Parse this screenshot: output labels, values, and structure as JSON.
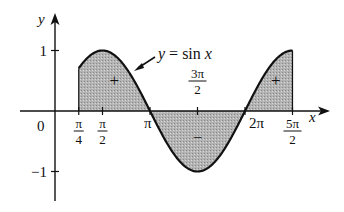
{
  "chart_data": {
    "type": "area",
    "title": "",
    "function_label": "y = sin x",
    "function_label_parts": {
      "y": "y",
      "eq": " = sin ",
      "x": "x"
    },
    "xlabel": "x",
    "ylabel": "y",
    "origin_label": "0",
    "xlim": [
      -1.1,
      8.8
    ],
    "ylim": [
      -1.5,
      1.45
    ],
    "shaded_interval": [
      0.7854,
      7.854
    ],
    "x_ticks": [
      {
        "value": 0.7854,
        "num": "π",
        "den": "4"
      },
      {
        "value": 1.5708,
        "num": "π",
        "den": "2"
      },
      {
        "value": 3.1416,
        "text": "π"
      },
      {
        "value": 4.7124,
        "num": "3π",
        "den": "2"
      },
      {
        "value": 6.2832,
        "text": "2π"
      },
      {
        "value": 7.854,
        "num": "5π",
        "den": "2"
      }
    ],
    "y_ticks": [
      {
        "value": 1,
        "text": "1"
      },
      {
        "value": -1,
        "text": "−1"
      }
    ],
    "region_signs": [
      {
        "x": 1.96,
        "y": 0.5,
        "text": "+"
      },
      {
        "x": 4.71,
        "y": -0.45,
        "text": "−"
      },
      {
        "x": 7.3,
        "y": 0.5,
        "text": "+"
      }
    ],
    "colors": {
      "fill": "#b3b3b3",
      "curve": "#111111",
      "axis": "#111111"
    }
  }
}
